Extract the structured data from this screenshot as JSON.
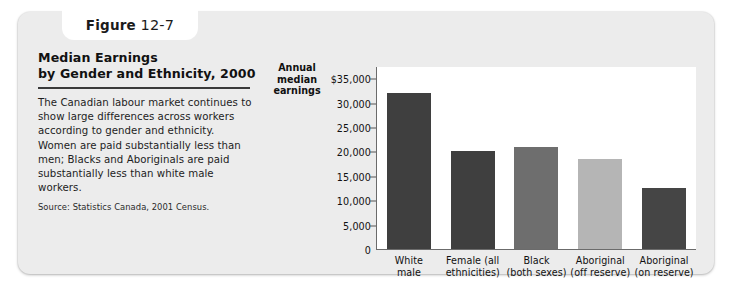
{
  "figure_tab": {
    "word": "Figure",
    "number": "12-7"
  },
  "description": {
    "title_line1": "Median Earnings",
    "title_line2": "by Gender and Ethnicity, 2000",
    "body": "The Canadian labour market continues to show large differences across workers according to gender and ethnicity. Women are paid substantially less than men; Blacks and Aboriginals are paid substantially less than white male workers.",
    "source": "Source: Statistics Canada, 2001 Census."
  },
  "axis_caption": {
    "line1": "Annual",
    "line2": "median",
    "line3": "earnings"
  },
  "colors": {
    "card_background": "#ececec",
    "plot_background": "#ffffff",
    "axis": "#6b6b6b",
    "bar_dark": "#3f3f3f",
    "bar_medium": "#6e6e6e",
    "bar_light": "#b5b5b5",
    "bar_darkest": "#454545"
  },
  "chart_data": {
    "type": "bar",
    "title": "Median Earnings by Gender and Ethnicity, 2000",
    "xlabel": "",
    "ylabel": "Annual median earnings",
    "ylim": [
      0,
      37500
    ],
    "grid": false,
    "legend": "none",
    "ytick_values": [
      35000,
      30000,
      25000,
      20000,
      15000,
      10000,
      5000,
      0
    ],
    "ytick_labels": [
      "$35,000",
      "30,000",
      "25,000",
      "20,000",
      "15,000",
      "10,000",
      "5,000",
      "0"
    ],
    "categories": [
      "White male",
      "Female (all ethnicities)",
      "Black (both sexes)",
      "Aboriginal (off reserve)",
      "Aboriginal (on reserve)"
    ],
    "category_lines": [
      [
        "White",
        "male"
      ],
      [
        "Female (all",
        "ethnicities)"
      ],
      [
        "Black",
        "(both sexes)"
      ],
      [
        "Aboriginal",
        "(off reserve)"
      ],
      [
        "Aboriginal",
        "(on reserve)"
      ]
    ],
    "values": [
      32000,
      20000,
      21000,
      18500,
      12500
    ],
    "bar_colors": [
      "#3f3f3f",
      "#3f3f3f",
      "#6e6e6e",
      "#b5b5b5",
      "#454545"
    ]
  }
}
